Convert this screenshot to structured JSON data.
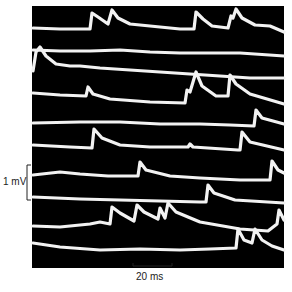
{
  "figure": {
    "type": "electrophysiology-trace-figure",
    "background": "#000000",
    "trace_color": "#f2f2f2",
    "panel": {
      "x": 32,
      "y": 6,
      "width": 252,
      "height": 262
    },
    "scale_bars": {
      "voltage": {
        "label": "1 mV",
        "x": 27,
        "y1": 165,
        "y2": 200
      },
      "time": {
        "label": "20 ms",
        "y": 266,
        "x1": 133,
        "x2": 172
      }
    },
    "trace_count": 10
  },
  "chart_data": {
    "type": "line",
    "title": "",
    "xlabel": "time (scale bar 20 ms)",
    "ylabel": "voltage (scale bar 1 mV)",
    "grid": false,
    "legend": "none",
    "note": "Ten sweeps of membrane potential recordings showing spontaneous miniature potentials; points are image-pixel coordinates (x, y).",
    "series": [
      {
        "name": "sweep-1",
        "points": [
          [
            33,
            28
          ],
          [
            60,
            29
          ],
          [
            90,
            29
          ],
          [
            92,
            13
          ],
          [
            98,
            17
          ],
          [
            108,
            24
          ],
          [
            112,
            10
          ],
          [
            118,
            18
          ],
          [
            130,
            24
          ],
          [
            150,
            26
          ],
          [
            180,
            29
          ],
          [
            194,
            29
          ],
          [
            196,
            12
          ],
          [
            203,
            19
          ],
          [
            212,
            26
          ],
          [
            228,
            28
          ],
          [
            231,
            16
          ],
          [
            233,
            18
          ],
          [
            236,
            9
          ],
          [
            242,
            18
          ],
          [
            255,
            25
          ],
          [
            270,
            26
          ],
          [
            284,
            32
          ]
        ]
      },
      {
        "name": "sweep-2",
        "points": [
          [
            33,
            50
          ],
          [
            60,
            51
          ],
          [
            90,
            51
          ],
          [
            120,
            50
          ],
          [
            150,
            52
          ],
          [
            180,
            53
          ],
          [
            210,
            53
          ],
          [
            240,
            53
          ],
          [
            284,
            56
          ]
        ]
      },
      {
        "name": "sweep-3",
        "points": [
          [
            33,
            71
          ],
          [
            36,
            52
          ],
          [
            40,
            47
          ],
          [
            46,
            56
          ],
          [
            56,
            64
          ],
          [
            70,
            66
          ],
          [
            80,
            66
          ],
          [
            100,
            68
          ],
          [
            130,
            70
          ],
          [
            160,
            72
          ],
          [
            190,
            74
          ],
          [
            220,
            76
          ],
          [
            250,
            78
          ],
          [
            284,
            78
          ]
        ]
      },
      {
        "name": "sweep-4",
        "points": [
          [
            33,
            93
          ],
          [
            60,
            95
          ],
          [
            86,
            96
          ],
          [
            88,
            87
          ],
          [
            93,
            94
          ],
          [
            110,
            99
          ],
          [
            150,
            102
          ],
          [
            185,
            103
          ],
          [
            187,
            90
          ],
          [
            190,
            92
          ],
          [
            196,
            72
          ],
          [
            202,
            86
          ],
          [
            216,
            96
          ],
          [
            228,
            96
          ],
          [
            230,
            75
          ],
          [
            236,
            84
          ],
          [
            250,
            94
          ],
          [
            284,
            104
          ]
        ]
      },
      {
        "name": "sweep-5",
        "points": [
          [
            33,
            123
          ],
          [
            80,
            122
          ],
          [
            120,
            122
          ],
          [
            160,
            124
          ],
          [
            200,
            124
          ],
          [
            230,
            125
          ],
          [
            254,
            126
          ],
          [
            256,
            110
          ],
          [
            262,
            118
          ],
          [
            284,
            124
          ]
        ]
      },
      {
        "name": "sweep-6",
        "points": [
          [
            33,
            145
          ],
          [
            70,
            147
          ],
          [
            92,
            148
          ],
          [
            94,
            129
          ],
          [
            102,
            138
          ],
          [
            120,
            145
          ],
          [
            150,
            147
          ],
          [
            188,
            147
          ],
          [
            190,
            144
          ],
          [
            193,
            147
          ],
          [
            238,
            150
          ],
          [
            240,
            150
          ],
          [
            242,
            132
          ],
          [
            250,
            142
          ],
          [
            284,
            150
          ]
        ]
      },
      {
        "name": "sweep-7",
        "points": [
          [
            33,
            175
          ],
          [
            60,
            172
          ],
          [
            80,
            174
          ],
          [
            108,
            176
          ],
          [
            138,
            176
          ],
          [
            140,
            162
          ],
          [
            146,
            170
          ],
          [
            170,
            176
          ],
          [
            200,
            178
          ],
          [
            240,
            180
          ],
          [
            270,
            180
          ],
          [
            272,
            161
          ],
          [
            278,
            170
          ],
          [
            284,
            173
          ]
        ]
      },
      {
        "name": "sweep-8",
        "points": [
          [
            33,
            197
          ],
          [
            80,
            199
          ],
          [
            120,
            200
          ],
          [
            160,
            201
          ],
          [
            200,
            202
          ],
          [
            206,
            202
          ],
          [
            208,
            185
          ],
          [
            214,
            193
          ],
          [
            235,
            200
          ],
          [
            284,
            203
          ]
        ]
      },
      {
        "name": "sweep-9",
        "points": [
          [
            33,
            226
          ],
          [
            60,
            227
          ],
          [
            90,
            224
          ],
          [
            100,
            222
          ],
          [
            110,
            224
          ],
          [
            112,
            207
          ],
          [
            120,
            213
          ],
          [
            134,
            221
          ],
          [
            137,
            205
          ],
          [
            144,
            212
          ],
          [
            158,
            219
          ],
          [
            160,
            208
          ],
          [
            165,
            218
          ],
          [
            168,
            203
          ],
          [
            176,
            212
          ],
          [
            200,
            222
          ],
          [
            240,
            229
          ],
          [
            268,
            231
          ],
          [
            277,
            224
          ],
          [
            279,
            210
          ],
          [
            284,
            220
          ]
        ]
      },
      {
        "name": "sweep-10",
        "points": [
          [
            33,
            243
          ],
          [
            60,
            247
          ],
          [
            100,
            250
          ],
          [
            140,
            249
          ],
          [
            180,
            250
          ],
          [
            210,
            249
          ],
          [
            236,
            248
          ],
          [
            238,
            229
          ],
          [
            244,
            240
          ],
          [
            252,
            243
          ],
          [
            255,
            229
          ],
          [
            262,
            240
          ],
          [
            272,
            246
          ],
          [
            284,
            250
          ]
        ]
      }
    ]
  }
}
